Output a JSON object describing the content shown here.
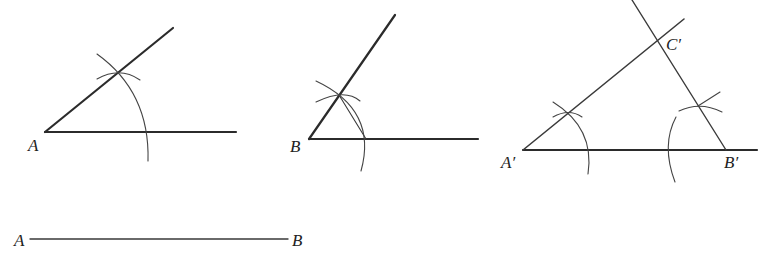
{
  "figure_1": {
    "vertex_label": "A"
  },
  "figure_2": {
    "vertex_label": "B"
  },
  "figure_3": {
    "labels": {
      "a_prime": "A′",
      "b_prime": "B′",
      "c_prime": "C′"
    }
  },
  "segment": {
    "start_label": "A",
    "end_label": "B"
  },
  "colors": {
    "stroke": "#2b2b2b",
    "background": "#ffffff"
  }
}
